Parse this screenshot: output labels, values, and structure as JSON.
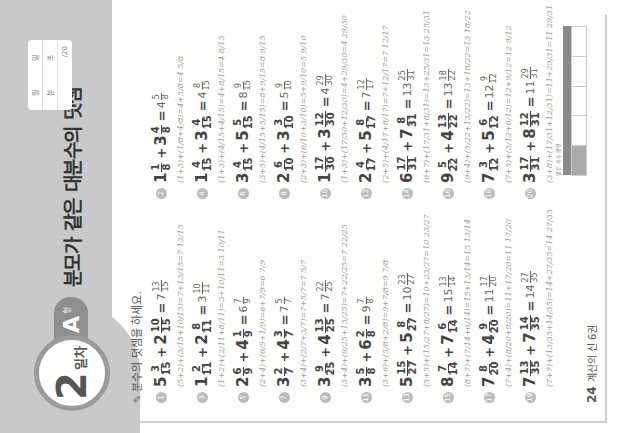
{
  "header": {
    "day_number": "2",
    "day_label": "일차",
    "type_letter": "A",
    "type_suffix": "형",
    "title": "분모가 같은 대분수의 덧셈",
    "score_box": {
      "row1": [
        "월",
        "일"
      ],
      "row2": [
        "분",
        "초"
      ],
      "total": "/20"
    }
  },
  "instruction": "분수의 덧셈을 하세요.",
  "problems": [
    {
      "no": "1",
      "a_whole": "5",
      "a_num": "3",
      "a_den": "15",
      "b_whole": "2",
      "b_num": "10",
      "b_den": "15",
      "ans_whole": "7",
      "ans_num": "13",
      "ans_den": "15",
      "work": "(5+2)+(3/15+10/15)=7+13/15=7 13/15"
    },
    {
      "no": "2",
      "a_whole": "1",
      "a_num": "1",
      "a_den": "8",
      "b_whole": "3",
      "b_num": "4",
      "b_den": "8",
      "ans_whole": "4",
      "ans_num": "5",
      "ans_den": "8",
      "work": "(1+3)+(1/8+4/8)=4+5/8=4 5/8"
    },
    {
      "no": "3",
      "a_whole": "1",
      "a_num": "2",
      "a_den": "11",
      "b_whole": "2",
      "b_num": "8",
      "b_den": "11",
      "ans_whole": "3",
      "ans_num": "10",
      "ans_den": "11",
      "work": "(1+2)+(2/11+8/11)=3+10/11=3 10/11"
    },
    {
      "no": "4",
      "a_whole": "1",
      "a_num": "4",
      "a_den": "15",
      "b_whole": "3",
      "b_num": "4",
      "b_den": "15",
      "ans_whole": "4",
      "ans_num": "8",
      "ans_den": "15",
      "work": "(1+3)+(4/15+4/15)=4+8/15=4 8/15"
    },
    {
      "no": "5",
      "a_whole": "2",
      "a_num": "6",
      "a_den": "9",
      "b_whole": "4",
      "b_num": "1",
      "b_den": "9",
      "ans_whole": "6",
      "ans_num": "7",
      "ans_den": "9",
      "work": "(2+4)+(6/9+1/9)=6+7/9=6 7/9"
    },
    {
      "no": "6",
      "a_whole": "3",
      "a_num": "4",
      "a_den": "15",
      "b_whole": "5",
      "b_num": "5",
      "b_den": "15",
      "ans_whole": "8",
      "ans_num": "9",
      "ans_den": "15",
      "work": "(3+5)+(4/15+5/15)=8+9/15=8 9/15"
    },
    {
      "no": "7",
      "a_whole": "3",
      "a_num": "2",
      "a_den": "7",
      "b_whole": "4",
      "b_num": "3",
      "b_den": "7",
      "ans_whole": "7",
      "ans_num": "5",
      "ans_den": "7",
      "work": "(3+4)+(2/7+3/7)=7+5/7=7 5/7"
    },
    {
      "no": "8",
      "a_whole": "2",
      "a_num": "6",
      "a_den": "10",
      "b_whole": "3",
      "b_num": "3",
      "b_den": "10",
      "ans_whole": "5",
      "ans_num": "9",
      "ans_den": "10",
      "work": "(2+3)+(6/10+3/10)=5+9/10=5 9/10"
    },
    {
      "no": "9",
      "a_whole": "3",
      "a_num": "9",
      "a_den": "25",
      "b_whole": "4",
      "b_num": "13",
      "b_den": "25",
      "ans_whole": "7",
      "ans_num": "22",
      "ans_den": "25",
      "work": "(3+4)+(9/25+13/25)=7+22/25=7 22/25"
    },
    {
      "no": "10",
      "a_whole": "1",
      "a_num": "17",
      "a_den": "30",
      "b_whole": "3",
      "b_num": "12",
      "b_den": "30",
      "ans_whole": "4",
      "ans_num": "29",
      "ans_den": "30",
      "work": "(1+3)+(17/30+12/30)=4+29/30=4 29/30"
    },
    {
      "no": "11",
      "a_whole": "3",
      "a_num": "5",
      "a_den": "8",
      "b_whole": "6",
      "b_num": "2",
      "b_den": "8",
      "ans_whole": "9",
      "ans_num": "7",
      "ans_den": "8",
      "work": "(3+6)+(5/8+2/8)=9+7/8=9 7/8"
    },
    {
      "no": "12",
      "a_whole": "2",
      "a_num": "4",
      "a_den": "17",
      "b_whole": "5",
      "b_num": "8",
      "b_den": "17",
      "ans_whole": "7",
      "ans_num": "12",
      "ans_den": "17",
      "work": "(2+5)+(4/17+8/17)=7+12/17=7 12/17"
    },
    {
      "no": "13",
      "a_whole": "5",
      "a_num": "15",
      "a_den": "27",
      "b_whole": "5",
      "b_num": "8",
      "b_den": "27",
      "ans_whole": "10",
      "ans_num": "23",
      "ans_den": "27",
      "work": "(5+5)+(15/27+8/27)=10+23/27=10 23/27"
    },
    {
      "no": "14",
      "a_whole": "6",
      "a_num": "17",
      "a_den": "31",
      "b_whole": "7",
      "b_num": "8",
      "b_den": "31",
      "ans_whole": "13",
      "ans_num": "25",
      "ans_den": "31",
      "work": "(6+7)+(17/31+8/31)=13+25/31=13 25/31"
    },
    {
      "no": "15",
      "a_whole": "8",
      "a_num": "7",
      "a_den": "14",
      "b_whole": "7",
      "b_num": "6",
      "b_den": "14",
      "ans_whole": "15",
      "ans_num": "13",
      "ans_den": "14",
      "work": "(8+7)+(7/14+6/14)=15+13/14=15 13/14"
    },
    {
      "no": "16",
      "a_whole": "9",
      "a_num": "5",
      "a_den": "22",
      "b_whole": "4",
      "b_num": "13",
      "b_den": "22",
      "ans_whole": "13",
      "ans_num": "18",
      "ans_den": "22",
      "work": "(9+4)+(5/22+13/22)=13+18/22=13 18/22"
    },
    {
      "no": "17",
      "a_whole": "7",
      "a_num": "8",
      "a_den": "20",
      "b_whole": "4",
      "b_num": "9",
      "b_den": "20",
      "ans_whole": "11",
      "ans_num": "17",
      "ans_den": "20",
      "work": "(7+4)+(8/20+9/20)=11+17/20=11 17/20"
    },
    {
      "no": "18",
      "a_whole": "7",
      "a_num": "3",
      "a_den": "12",
      "b_whole": "5",
      "b_num": "6",
      "b_den": "12",
      "ans_whole": "12",
      "ans_num": "9",
      "ans_den": "12",
      "work": "(7+5)+(3/12+6/12)=12+9/12=12 9/12"
    },
    {
      "no": "19",
      "a_whole": "7",
      "a_num": "13",
      "a_den": "35",
      "b_whole": "7",
      "b_num": "14",
      "b_den": "35",
      "ans_whole": "14",
      "ans_num": "27",
      "ans_den": "35",
      "work": "(7+7)+(13/35+14/35)=14+27/35=14 27/35"
    },
    {
      "no": "20",
      "a_whole": "3",
      "a_num": "17",
      "a_den": "31",
      "b_whole": "8",
      "b_num": "12",
      "b_den": "31",
      "ans_whole": "11",
      "ans_num": "29",
      "ans_den": "31",
      "work": "(3+8)+(17/31+12/31)=11+29/31=11 29/31"
    }
  ],
  "footer": {
    "page_number": "24",
    "book_title": "계산의 신 6권"
  },
  "summary": {
    "caption": "맞은 개수 확인",
    "headers": [
      "",
      "",
      "",
      "",
      ""
    ],
    "cells": [
      "",
      "",
      "",
      "",
      ""
    ]
  },
  "colors": {
    "band": "#c9c9c9",
    "badge_ring": "#9a9a9a",
    "tab": "#8e8e8e",
    "ink": "#444444",
    "handwriting": "#9a9a9a"
  }
}
